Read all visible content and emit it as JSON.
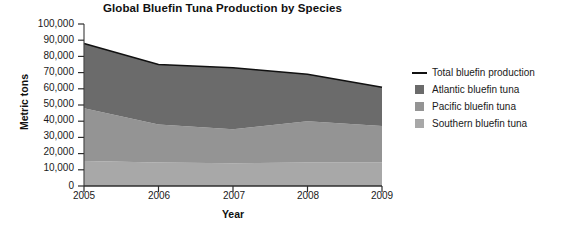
{
  "chart_data": {
    "type": "area",
    "title": "Global Bluefin Tuna Production by Species",
    "xlabel": "Year",
    "ylabel": "Metric tons",
    "categories": [
      "2005",
      "2006",
      "2007",
      "2008",
      "2009"
    ],
    "x": [
      2005,
      2006,
      2007,
      2008,
      2009
    ],
    "ylim": [
      0,
      100000
    ],
    "xlim": [
      2005,
      2009
    ],
    "grid": false,
    "stacked": true,
    "legend_position": "right",
    "ytick_labels": [
      "100,000",
      "90,000",
      "80,000",
      "70,000",
      "60,000",
      "50,000",
      "40,000",
      "30,000",
      "20,000",
      "10,000",
      "0"
    ],
    "ytick_values": [
      100000,
      90000,
      80000,
      70000,
      60000,
      50000,
      40000,
      30000,
      20000,
      10000,
      0
    ],
    "series": [
      {
        "name": "Southern bluefin tuna",
        "color": "#a8a8a8",
        "values": [
          15500,
          14500,
          14000,
          14500,
          14500
        ]
      },
      {
        "name": "Pacific bluefin tuna",
        "color": "#949494",
        "values": [
          32500,
          23500,
          21000,
          25500,
          22500
        ]
      },
      {
        "name": "Atlantic bluefin tuna",
        "color": "#6b6b6b",
        "values": [
          40000,
          37000,
          38000,
          29000,
          24000
        ]
      }
    ],
    "total_line": {
      "name": "Total bluefin production",
      "color": "#111111",
      "values": [
        88000,
        75000,
        73000,
        69000,
        61000
      ]
    }
  },
  "legend": {
    "items": [
      {
        "label": "Total bluefin production",
        "marker": "line",
        "color": "#111111"
      },
      {
        "label": "Atlantic bluefin tuna",
        "marker": "square",
        "color": "#6b6b6b"
      },
      {
        "label": "Pacific bluefin tuna",
        "marker": "square",
        "color": "#949494"
      },
      {
        "label": "Southern bluefin tuna",
        "marker": "square",
        "color": "#a8a8a8"
      }
    ]
  }
}
